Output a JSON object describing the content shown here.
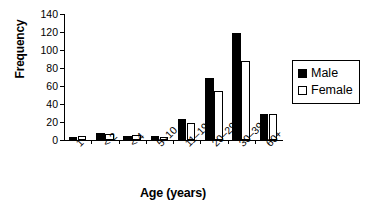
{
  "chart_data": {
    "type": "bar",
    "title": "",
    "xlabel": "Age (years)",
    "ylabel": "Frequency",
    "categories": [
      "1",
      "< 2",
      "< 4",
      "5–10",
      "11–19",
      "20–29",
      "30–39",
      "60+"
    ],
    "series": [
      {
        "name": "Male",
        "color": "#000000",
        "values": [
          3,
          8,
          4,
          5,
          23,
          69,
          119,
          29
        ]
      },
      {
        "name": "Female",
        "color": "#ffffff",
        "values": [
          5,
          7,
          6,
          3,
          19,
          54,
          88,
          29
        ]
      }
    ],
    "ylim": [
      0,
      140
    ],
    "yticks": [
      0,
      20,
      40,
      60,
      80,
      100,
      120,
      140
    ],
    "ytick_labels": [
      "0",
      "20",
      "40",
      "60",
      "80",
      "100",
      "120",
      "140"
    ],
    "grid": false,
    "legend_position": "right"
  },
  "legend": {
    "entries": [
      {
        "label": "Male",
        "swatch": "filled-square"
      },
      {
        "label": "Female",
        "swatch": "hollow-square"
      }
    ]
  },
  "axes": {
    "y_title": "Frequency",
    "x_title": "Age (years)"
  }
}
